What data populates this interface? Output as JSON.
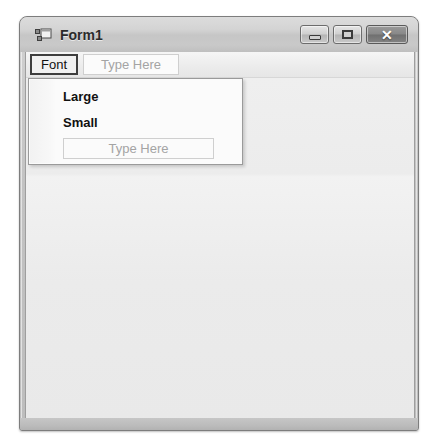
{
  "window": {
    "title": "Form1",
    "icon": "form-designer-icon",
    "controls": {
      "minimize": {
        "name": "minimize-button",
        "glyph": "–"
      },
      "maximize": {
        "name": "maximize-button",
        "glyph": "□"
      },
      "close": {
        "name": "close-button",
        "glyph": "✕"
      }
    }
  },
  "menu_strip": {
    "items": [
      {
        "label": "Font",
        "state": "selected"
      }
    ],
    "type_here_placeholder": "Type Here"
  },
  "dropdown": {
    "owner": "Font",
    "items": [
      {
        "label": "Large"
      },
      {
        "label": "Small"
      }
    ],
    "type_here_placeholder": "Type Here"
  },
  "colors": {
    "frame_border": "#7d7d7d",
    "title_bar": "#cfcfcf",
    "client_background": "#ececec",
    "menu_selected_border": "#3d3d3d",
    "placeholder_text": "#a4a4a4",
    "menu_text": "#111111"
  }
}
